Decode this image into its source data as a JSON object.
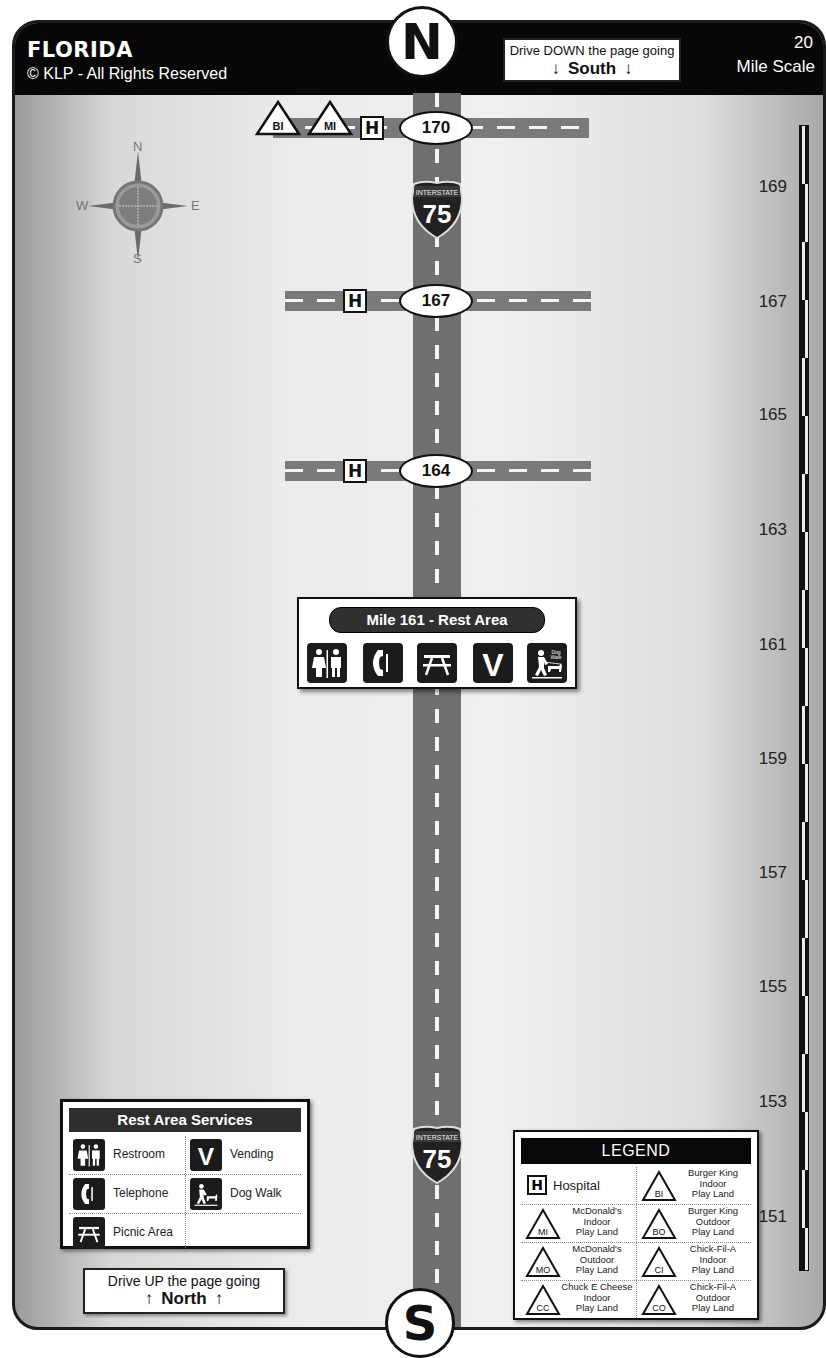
{
  "header": {
    "state": "FLORIDA",
    "copyright": "© KLP - All Rights Reserved",
    "north_badge": "N",
    "south_badge": "S",
    "drive_down": {
      "line1": "Drive DOWN the page going",
      "direction": "South",
      "arrow": "↓"
    },
    "scale": {
      "value": "20",
      "label": "Mile Scale"
    }
  },
  "compass_rose": {
    "n": "N",
    "e": "E",
    "s": "S",
    "w": "W"
  },
  "highway": {
    "route_label": "INTERSTATE",
    "route_number": "75",
    "exits": [
      {
        "mile": "170",
        "services": [
          "BI",
          "MI",
          "H"
        ]
      },
      {
        "mile": "167",
        "services": [
          "H"
        ]
      },
      {
        "mile": "164",
        "services": [
          "H"
        ]
      }
    ],
    "rest_area": {
      "title": "Mile 161 - Rest Area",
      "services": [
        "restroom",
        "telephone",
        "picnic-area",
        "vending",
        "dog-walk"
      ],
      "dog_walk_text": "Dog Walk"
    }
  },
  "mile_scale": {
    "labels": [
      "169",
      "167",
      "165",
      "163",
      "161",
      "159",
      "157",
      "155",
      "153",
      "151"
    ]
  },
  "rest_area_services": {
    "title": "Rest Area Services",
    "items": [
      {
        "icon": "restroom",
        "label": "Restroom"
      },
      {
        "icon": "vending",
        "label": "Vending"
      },
      {
        "icon": "telephone",
        "label": "Telephone"
      },
      {
        "icon": "dog-walk",
        "label": "Dog Walk"
      },
      {
        "icon": "picnic-area",
        "label": "Picnic Area"
      }
    ]
  },
  "drive_up": {
    "line1": "Drive UP the page going",
    "direction": "North",
    "arrow": "↑"
  },
  "legend": {
    "title": "LEGEND",
    "items": [
      {
        "code": "H",
        "label": "Hospital"
      },
      {
        "code": "BI",
        "label": "Burger King Indoor Play Land",
        "lines": [
          "Burger King",
          "Indoor",
          "Play Land"
        ]
      },
      {
        "code": "MI",
        "label": "McDonald's Indoor Play Land",
        "lines": [
          "McDonald's",
          "Indoor",
          "Play Land"
        ]
      },
      {
        "code": "BO",
        "label": "Burger King Outdoor Play Land",
        "lines": [
          "Burger King",
          "Outdoor",
          "Play Land"
        ]
      },
      {
        "code": "MO",
        "label": "McDonald's Outdoor Play Land",
        "lines": [
          "McDonald's",
          "Outdoor",
          "Play Land"
        ]
      },
      {
        "code": "CI",
        "label": "Chick-Fil-A Indoor Play Land",
        "lines": [
          "Chick-Fil-A",
          "Indoor",
          "Play Land"
        ]
      },
      {
        "code": "CC",
        "label": "Chuck E Cheese Indoor Play Land",
        "lines": [
          "Chuck E Cheese",
          "Indoor",
          "Play Land"
        ]
      },
      {
        "code": "CO",
        "label": "Chick-Fil-A Outdoor Play Land",
        "lines": [
          "Chick-Fil-A",
          "Outdoor",
          "Play Land"
        ]
      }
    ]
  },
  "colors": {
    "header_bg": "#070707",
    "road": "#6f6f6f",
    "sign_dark": "#1b1b1b",
    "background_mid": "#ececec"
  }
}
